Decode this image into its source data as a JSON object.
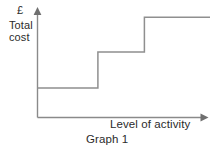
{
  "figure": {
    "caption": "Graph 1",
    "currency_symbol": "£",
    "y_axis_label_line1": "Total",
    "y_axis_label_line2": "cost",
    "x_axis_label": "Level of activity",
    "line_color": "#8f8f8f",
    "axis_color": "#8a8a8a",
    "text_color": "#2b2b2b",
    "background_color": "#ffffff"
  },
  "chart_data": {
    "type": "line",
    "title": "Graph 1",
    "subtitle": "",
    "xlabel": "Level of activity",
    "ylabel": "Total cost",
    "y_unit": "£",
    "grid": false,
    "legend": "none",
    "xlim": [
      0,
      100
    ],
    "ylim": [
      0,
      100
    ],
    "x_ticks": [],
    "y_ticks": [],
    "annotations": [],
    "series": [
      {
        "name": "Step fixed cost",
        "step": "post",
        "x": [
          0,
          35,
          35,
          62,
          62,
          100
        ],
        "y": [
          28,
          28,
          62,
          62,
          95,
          95
        ]
      }
    ],
    "steps": [
      {
        "index": 1,
        "x_start": 0,
        "x_end": 35,
        "level": 28
      },
      {
        "index": 2,
        "x_start": 35,
        "x_end": 62,
        "level": 62
      },
      {
        "index": 3,
        "x_start": 62,
        "x_end": 100,
        "level": 95
      }
    ]
  }
}
